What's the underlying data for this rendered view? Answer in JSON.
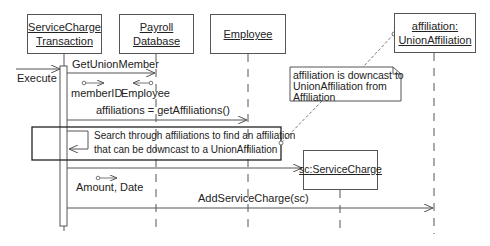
{
  "objects": {
    "transaction": {
      "line1": "ServiceCharge",
      "line2": "Transaction"
    },
    "payroll": {
      "line1": "Payroll",
      "line2": "Database"
    },
    "employee": {
      "line1": "Employee"
    },
    "affiliation": {
      "line1": "affiliation:",
      "line2": "UnionAffiliation"
    },
    "servicecharge": {
      "line1": "sc:ServiceCharge"
    }
  },
  "messages": {
    "execute": "Execute",
    "get_union_member": "GetUnionMember",
    "member_id": "memberID",
    "employee_return": "Employee",
    "get_affiliations": "affiliations = getAffiliations()",
    "amount_date": "Amount, Date",
    "add_service_charge": "AddServiceCharge(sc)"
  },
  "search_frame": {
    "line1": "Search through affiliations to find an affiliation",
    "line2": "that can be downcast to a UnionAffiliation"
  },
  "note": {
    "line1": "affiliation is downcast to",
    "line2": "UnionAffiliation from",
    "line3": "Affiliation"
  },
  "colors": {
    "line": "#555555",
    "text": "#222222",
    "background": "#ffffff"
  }
}
